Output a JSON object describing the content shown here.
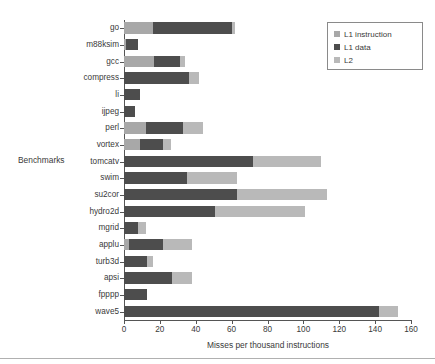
{
  "chart_data": {
    "type": "bar",
    "orientation": "horizontal",
    "stacked": true,
    "title": "",
    "xlabel": "Misses per thousand instructions",
    "ylabel": "Benchmarks",
    "xlim": [
      0,
      160
    ],
    "xticks": [
      0,
      20,
      40,
      60,
      80,
      100,
      120,
      140,
      160
    ],
    "grid": false,
    "legend_position": "top-right",
    "categories": [
      "go",
      "m88ksim",
      "gcc",
      "compress",
      "li",
      "ijpeg",
      "perl",
      "vortex",
      "tomcatv",
      "swim",
      "su2cor",
      "hydro2d",
      "mgrid",
      "applu",
      "turb3d",
      "apsi",
      "fpppp",
      "wave5"
    ],
    "series": [
      {
        "name": "L1 instruction",
        "color": "#a8a8a8",
        "values": [
          16,
          1,
          17,
          0,
          0,
          0,
          12,
          9,
          0,
          0,
          0,
          0,
          0,
          3,
          0,
          0,
          0,
          0
        ]
      },
      {
        "name": "L1 data",
        "color": "#4d4d4d",
        "values": [
          44,
          7,
          14,
          36,
          9,
          6,
          21,
          13,
          72,
          35,
          63,
          51,
          8,
          19,
          13,
          27,
          13,
          142
        ]
      },
      {
        "name": "L2",
        "color": "#b9b9b9",
        "values": [
          2,
          0,
          3,
          6,
          0,
          0,
          11,
          4,
          38,
          28,
          50,
          50,
          4,
          16,
          3,
          11,
          0,
          11
        ]
      }
    ],
    "totals": [
      62,
      8,
      34,
      42,
      9,
      6,
      44,
      26,
      110,
      63,
      113,
      101,
      12,
      38,
      16,
      38,
      13,
      153
    ]
  },
  "legend": {
    "items": [
      {
        "label": "L1 instruction",
        "color": "#a8a8a8"
      },
      {
        "label": "L1 data",
        "color": "#4d4d4d"
      },
      {
        "label": "L2",
        "color": "#b9b9b9"
      }
    ]
  },
  "axes": {
    "x_title": "Misses per thousand instructions",
    "y_title": "Benchmarks",
    "x_tick_labels": [
      "0",
      "20",
      "40",
      "60",
      "80",
      "100",
      "120",
      "140",
      "160"
    ]
  }
}
